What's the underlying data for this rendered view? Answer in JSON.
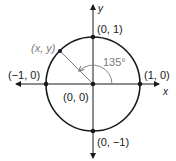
{
  "diagram": {
    "axes": {
      "x_label": "x",
      "y_label": "y"
    },
    "points": [
      {
        "id": "top",
        "label": "(0, 1)"
      },
      {
        "id": "right",
        "label": "(1, 0)"
      },
      {
        "id": "left",
        "label": "(−1, 0)"
      },
      {
        "id": "bottom",
        "label": "(0, −1)"
      },
      {
        "id": "origin",
        "label": "(0, 0)"
      },
      {
        "id": "terminal",
        "label": "(x, y)"
      }
    ],
    "angle": {
      "label": "135°",
      "degrees": 135
    },
    "colors": {
      "stroke": "#1a1a1a",
      "gray": "#7a7a7a",
      "background": "#ffffff"
    }
  }
}
